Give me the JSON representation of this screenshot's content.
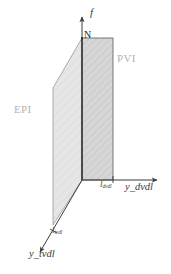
{
  "figure": {
    "background_color": "#ffffff",
    "axes": [
      {
        "id": "f",
        "name": "f",
        "label": "f",
        "direction": "up",
        "label_color": "#3a3a3a"
      },
      {
        "id": "y_dvdl",
        "name": "y_dvdl",
        "label": "y_dvdl",
        "direction": "right",
        "label_color": "#3a3a3a"
      },
      {
        "id": "y_tvdl",
        "name": "y_tvdl",
        "label": "y_tvdl",
        "direction": "down-left",
        "label_color": "#3a3a3a"
      }
    ],
    "planes": [
      {
        "id": "pvi",
        "label": "PVI",
        "shape": "rectangle",
        "fill_color": "#d4d4d4",
        "stroke_color": "#555555",
        "label_color": "#b3b3b3"
      },
      {
        "id": "epi",
        "label": "EPI",
        "shape": "parallelogram",
        "fill_color": "#e4e4e4",
        "stroke_color": "#7a7a7a",
        "label_color": "#b3b3b3"
      }
    ],
    "points": [
      {
        "id": "N",
        "label": "N",
        "color": "#2b2b2b"
      }
    ],
    "tick_labels": [
      {
        "id": "l_dvdl",
        "base": "l",
        "subscript": "dvdl",
        "label": "l_dvdl",
        "axis": "y_dvdl"
      },
      {
        "id": "l_tvdl",
        "base": "l",
        "subscript": "tvdl",
        "label": "l_tvdl",
        "axis": "y_tvdl"
      }
    ],
    "axis_labels": [
      {
        "id": "y_dvdl",
        "base": "y_",
        "subscript": "dvdl",
        "label": "y_dvdl"
      },
      {
        "id": "y_tvdl",
        "base": "y_",
        "subscript": "tvdl",
        "label": "y_tvdl"
      }
    ]
  }
}
